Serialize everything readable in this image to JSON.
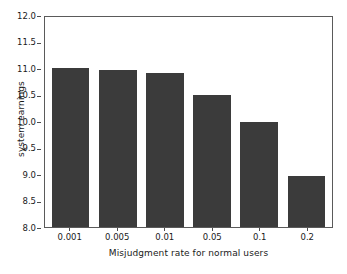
{
  "chart_data": {
    "type": "bar",
    "title": "",
    "xlabel": "Misjudgment rate for normal users",
    "ylabel": "system earnings",
    "categories": [
      "0.001",
      "0.005",
      "0.01",
      "0.05",
      "0.1",
      "0.2"
    ],
    "values": [
      11.0,
      10.96,
      10.91,
      10.49,
      9.99,
      8.96
    ],
    "ylim": [
      8.0,
      12.0
    ],
    "yticks": [
      "8.0",
      "8.5",
      "9.0",
      "9.5",
      "10.0",
      "10.5",
      "11.0",
      "11.5",
      "12.0"
    ],
    "ytick_values": [
      8.0,
      8.5,
      9.0,
      9.5,
      10.0,
      10.5,
      11.0,
      11.5,
      12.0
    ],
    "grid": false,
    "legend": null,
    "bar_color": "#3b3b3b",
    "background_color": "#ffffff",
    "frame_color": "#5a5a5a"
  }
}
